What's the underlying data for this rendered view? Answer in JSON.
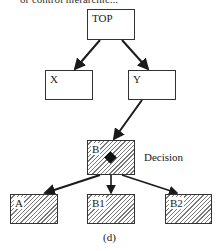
{
  "header_fragment": "or control hierarchic...",
  "nodes": {
    "top": {
      "label": "TOP",
      "style": "plain"
    },
    "x": {
      "label": "X",
      "style": "plain"
    },
    "y": {
      "label": "Y",
      "style": "plain"
    },
    "b": {
      "label": "B",
      "style": "hatched",
      "marker": "diamond"
    },
    "a": {
      "label": "A",
      "style": "hatched"
    },
    "b1": {
      "label": "B1",
      "style": "hatched"
    },
    "b2": {
      "label": "B2",
      "style": "hatched"
    }
  },
  "edges": [
    {
      "from": "TOP",
      "to": "X"
    },
    {
      "from": "TOP",
      "to": "Y"
    },
    {
      "from": "Y",
      "to": "B"
    },
    {
      "from": "B",
      "to": "A"
    },
    {
      "from": "B",
      "to": "B1"
    },
    {
      "from": "B",
      "to": "B2"
    }
  ],
  "annotations": {
    "decision": "Decision"
  },
  "caption": "(d)",
  "colors": {
    "line": "#1a1a1a",
    "hatch": "#7a7a7a",
    "background": "#ffffff"
  }
}
